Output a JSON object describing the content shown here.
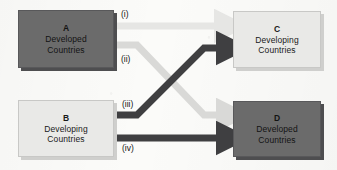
{
  "diagram": {
    "type": "flow-diagram",
    "background_color": "#fbfbf9",
    "colors": {
      "dark_node_fill": "#6b6b6b",
      "light_node_fill": "#e9e9e7",
      "dark_arrow": "#3f3f41",
      "light_arrow": "#d9d9d7",
      "pale_arrow": "#e6e6e4",
      "text": "#141414"
    },
    "nodes": [
      {
        "id": "A",
        "label_id": "A",
        "label_line1": "Developed",
        "label_line2": "Countries",
        "style": "dark",
        "position": "top-left"
      },
      {
        "id": "C",
        "label_id": "C",
        "label_line1": "Developing",
        "label_line2": "Countries",
        "style": "light",
        "position": "top-right"
      },
      {
        "id": "B",
        "label_id": "B",
        "label_line1": "Developing",
        "label_line2": "Countries",
        "style": "light",
        "position": "bottom-left"
      },
      {
        "id": "D",
        "label_id": "D",
        "label_line1": "Developed",
        "label_line2": "Countries",
        "style": "dark",
        "position": "bottom-right"
      }
    ],
    "edges": [
      {
        "label": "(i)",
        "from": "A",
        "to": "C",
        "shade": "pale",
        "path": "straight-horizontal-top"
      },
      {
        "label": "(ii)",
        "from": "A",
        "to": "D",
        "shade": "light",
        "path": "diagonal-down-right"
      },
      {
        "label": "(iii)",
        "from": "B",
        "to": "C",
        "shade": "dark",
        "path": "diagonal-up-right"
      },
      {
        "label": "(iv)",
        "from": "B",
        "to": "D",
        "shade": "dark",
        "path": "straight-horizontal-bottom"
      }
    ]
  }
}
